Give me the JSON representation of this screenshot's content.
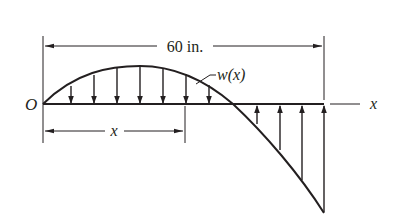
{
  "figure": {
    "type": "distributed-load-beam",
    "span_label": "60 in.",
    "origin_label": "O",
    "axis_label": "x",
    "position_label": "x",
    "load_label": "w(x)",
    "colors": {
      "ink": "#231f20",
      "background": "#ffffff"
    },
    "load": {
      "shape": "parabolic",
      "downward_arrow_count": 7,
      "upward_arrow_count": 4,
      "description": "Load acts downward over the left portion, crosses zero, then acts upward with increasing magnitude toward the right end at x = 60 in."
    }
  }
}
